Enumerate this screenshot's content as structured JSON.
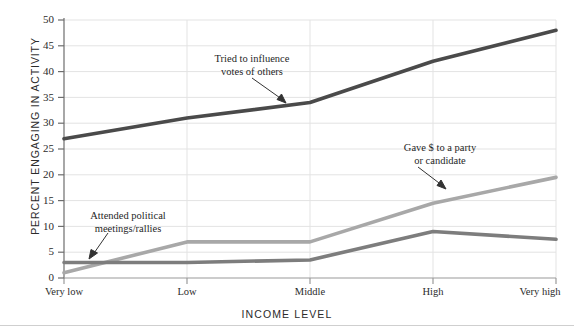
{
  "chart_data": {
    "type": "line",
    "title": "",
    "xlabel": "INCOME LEVEL",
    "ylabel": "PERCENT ENGAGING IN ACTIVITY",
    "categories": [
      "Very low",
      "Low",
      "Middle",
      "High",
      "Very high"
    ],
    "yticks": [
      0,
      5,
      10,
      15,
      20,
      25,
      30,
      35,
      40,
      45,
      50
    ],
    "ylim": [
      0,
      50
    ],
    "grid": true,
    "legend": "annotations",
    "series": [
      {
        "name": "Tried to influence votes of others",
        "color": "#4a4a4a",
        "values": [
          27,
          31,
          34,
          42,
          48
        ]
      },
      {
        "name": "Gave $ to a party or candidate",
        "color": "#a8a8a8",
        "values": [
          1,
          7,
          7,
          14.5,
          19.5
        ]
      },
      {
        "name": "Attended political meetings/rallies",
        "color": "#7d7d7d",
        "values": [
          3,
          3,
          3.5,
          9,
          7.5
        ]
      }
    ],
    "annotations": [
      {
        "id": "influence",
        "line1": "Tried to influence",
        "line2": "votes of others"
      },
      {
        "id": "gave-money",
        "line1": "Gave $ to a party",
        "line2": "or candidate"
      },
      {
        "id": "attended",
        "line1": "Attended political",
        "line2": "meetings/rallies"
      }
    ]
  },
  "axis": {
    "y_tick_labels": [
      "50",
      "45",
      "40",
      "35",
      "30",
      "25",
      "20",
      "15",
      "10",
      "5",
      "0"
    ],
    "x_tick_labels": [
      "Very low",
      "Low",
      "Middle",
      "High",
      "Very high"
    ]
  }
}
